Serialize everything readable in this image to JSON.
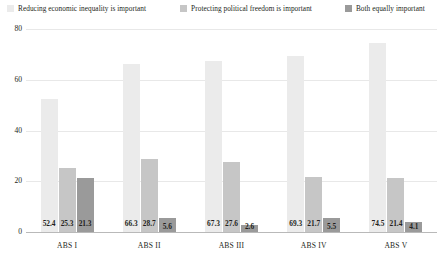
{
  "chart_data": {
    "type": "bar",
    "title": "",
    "xlabel": "",
    "ylabel": "",
    "categories": [
      "ABS I",
      "ABS II",
      "ABS III",
      "ABS IV",
      "ABS V"
    ],
    "series": [
      {
        "name": "Reducing economic inequality is important",
        "color": "#ebebeb",
        "values": [
          52.4,
          66.3,
          67.3,
          69.3,
          74.5
        ]
      },
      {
        "name": "Protecting political freedom is important",
        "color": "#c6c6c6",
        "values": [
          25.3,
          28.7,
          27.6,
          21.7,
          21.4
        ]
      },
      {
        "name": "Both equally important",
        "color": "#9a9a9a",
        "values": [
          21.3,
          5.6,
          2.6,
          5.5,
          4.1
        ]
      }
    ],
    "ylim": [
      0,
      80
    ],
    "yticks": [
      "0",
      "20",
      "40",
      "60",
      "80"
    ],
    "grid": true,
    "legend_position": "top"
  },
  "legend": {
    "items": [
      {
        "label": "Reducing economic inequality is important",
        "swatch": "#ebebeb"
      },
      {
        "label": "Protecting political freedom is important",
        "swatch": "#c6c6c6"
      },
      {
        "label": "Both equally important",
        "swatch": "#9a9a9a"
      }
    ]
  },
  "axis": {
    "y_ticks": [
      "80",
      "60",
      "40",
      "20",
      "0"
    ]
  },
  "colors": {
    "grid": "#e8e8e8",
    "axis": "#b9b9b9",
    "text": "#231f20",
    "background": "#ffffff"
  }
}
